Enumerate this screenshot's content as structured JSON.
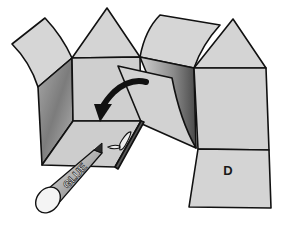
{
  "figure": {
    "panel_label": "D",
    "glue_stick_label": "GLUE",
    "arrow": "curved-fold-arrow",
    "colors": {
      "face_light": "#d4d4d4",
      "face_mid": "#c8c8c8",
      "face_shadow_dark": "#7a7a7a",
      "outline": "#111111",
      "background": "#ffffff",
      "arrow": "#111111"
    }
  }
}
